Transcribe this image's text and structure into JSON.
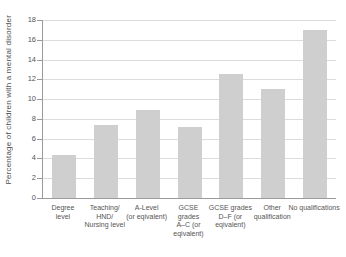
{
  "chart_data": {
    "type": "bar",
    "title": "",
    "ylabel": "Percentage of children with a mental disorder",
    "xlabel": "",
    "ylim": [
      0,
      18
    ],
    "yticks": [
      0,
      2,
      4,
      6,
      8,
      10,
      12,
      14,
      16,
      18
    ],
    "grid": true,
    "legend_position": "none",
    "bar_color": "#cfcfcf",
    "axis_color": "#9a9a9a",
    "grid_color": "#dcdcdc",
    "text_color": "#555555",
    "categories": [
      "Degree level",
      "Teaching/ HND/ Nursing level",
      "A-Level (or eqivalent)",
      "GCSE grades A–C (or eqivalent)",
      "GCSE grades D–F (or eqivalent)",
      "Other qualification",
      "No qualifications"
    ],
    "category_lines": [
      [
        "Degree",
        "level"
      ],
      [
        "Teaching/",
        "HND/",
        "Nursing level"
      ],
      [
        "A-Level",
        "(or eqivalent)"
      ],
      [
        "GCSE",
        "grades",
        "A–C (or",
        "eqivalent)"
      ],
      [
        "GCSE grades",
        "D–F (or",
        "eqivalent)"
      ],
      [
        "Other",
        "qualification"
      ],
      [
        "No qualifications"
      ]
    ],
    "values": [
      4.4,
      7.4,
      8.9,
      7.2,
      12.5,
      11,
      17
    ]
  }
}
